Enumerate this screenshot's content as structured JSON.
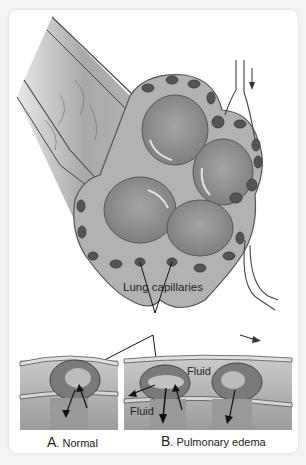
{
  "figure": {
    "type": "anatomical-illustration",
    "labels": {
      "lung_capillaries": "Lung capillaries",
      "fluid_top": "Fluid",
      "fluid_bottom": "Fluid"
    },
    "panels": [
      {
        "letter": "A",
        "suffix": ". Normal"
      },
      {
        "letter": "B",
        "suffix": ". Pulmonary edema"
      }
    ],
    "colors": {
      "background": "#f4f4f4",
      "card": "#ffffff",
      "tissue": "#a8a8a8",
      "alveolus": "#8e8e8e",
      "capillary": "#5a5a5a",
      "line": "#222222"
    }
  }
}
